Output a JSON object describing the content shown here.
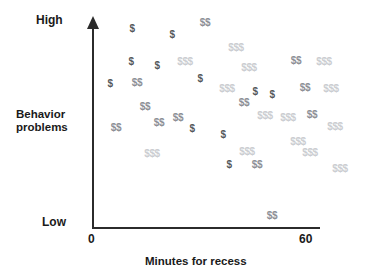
{
  "chart_data": {
    "type": "scatter",
    "title": "",
    "xlabel": "Minutes for recess",
    "ylabel": "Behavior problems",
    "xlim": [
      0,
      60
    ],
    "ylim": [
      "Low",
      "High"
    ],
    "xtick_labels": [
      "0",
      "60"
    ],
    "ytick_labels": [
      "Low",
      "High"
    ],
    "grid": false,
    "legend": "none",
    "marker_levels": [
      {
        "symbol": "$",
        "color": "#55585c",
        "meaning": "single-dollar marker"
      },
      {
        "symbol": "$$",
        "color": "#8d9096",
        "meaning": "double-dollar marker"
      },
      {
        "symbol": "$$$",
        "color": "#cbcdd1",
        "meaning": "triple-dollar marker"
      }
    ],
    "relationship": "negative",
    "points": [
      {
        "symbol": "$",
        "x": 10.4,
        "y": 0.925,
        "px": 132,
        "py": 28
      },
      {
        "symbol": "$",
        "x": 21.0,
        "y": 0.895,
        "px": 172,
        "py": 34
      },
      {
        "symbol": "$$",
        "x": 29.8,
        "y": 0.955,
        "px": 205,
        "py": 22
      },
      {
        "symbol": "$$$",
        "x": 38.0,
        "y": 0.83,
        "px": 236,
        "py": 47
      },
      {
        "symbol": "$",
        "x": 10.2,
        "y": 0.76,
        "px": 131,
        "py": 61
      },
      {
        "symbol": "$",
        "x": 17.1,
        "y": 0.74,
        "px": 157,
        "py": 65
      },
      {
        "symbol": "$$$",
        "x": 24.5,
        "y": 0.76,
        "px": 185,
        "py": 61
      },
      {
        "symbol": "$$$",
        "x": 41.5,
        "y": 0.73,
        "px": 249,
        "py": 67
      },
      {
        "symbol": "$$",
        "x": 54.0,
        "y": 0.765,
        "px": 296,
        "py": 60
      },
      {
        "symbol": "$$$",
        "x": 61.5,
        "y": 0.76,
        "px": 324,
        "py": 61
      },
      {
        "symbol": "$",
        "x": 4.5,
        "y": 0.645,
        "px": 110,
        "py": 83
      },
      {
        "symbol": "$$",
        "x": 11.5,
        "y": 0.65,
        "px": 137,
        "py": 82
      },
      {
        "symbol": "$",
        "x": 28.5,
        "y": 0.67,
        "px": 200,
        "py": 78
      },
      {
        "symbol": "$$$",
        "x": 35.5,
        "y": 0.62,
        "px": 227,
        "py": 88
      },
      {
        "symbol": "$",
        "x": 43.0,
        "y": 0.605,
        "px": 255,
        "py": 91
      },
      {
        "symbol": "$",
        "x": 47.5,
        "y": 0.59,
        "px": 272,
        "py": 94
      },
      {
        "symbol": "$$",
        "x": 56.5,
        "y": 0.625,
        "px": 305,
        "py": 87
      },
      {
        "symbol": "$$$",
        "x": 63.5,
        "y": 0.62,
        "px": 331,
        "py": 88
      },
      {
        "symbol": "$$",
        "x": 13.5,
        "y": 0.525,
        "px": 145,
        "py": 106
      },
      {
        "symbol": "$$",
        "x": 40.0,
        "y": 0.545,
        "px": 244,
        "py": 102
      },
      {
        "symbol": "$$",
        "x": 22.5,
        "y": 0.47,
        "px": 178,
        "py": 117
      },
      {
        "symbol": "$$$",
        "x": 45.5,
        "y": 0.48,
        "px": 265,
        "py": 115
      },
      {
        "symbol": "$$$",
        "x": 52.0,
        "y": 0.47,
        "px": 288,
        "py": 117
      },
      {
        "symbol": "$$",
        "x": 58.5,
        "y": 0.485,
        "px": 312,
        "py": 114
      },
      {
        "symbol": "$$",
        "x": 6.0,
        "y": 0.42,
        "px": 116,
        "py": 127
      },
      {
        "symbol": "$$",
        "x": 17.5,
        "y": 0.445,
        "px": 159,
        "py": 122
      },
      {
        "symbol": "$",
        "x": 26.5,
        "y": 0.415,
        "px": 192,
        "py": 128
      },
      {
        "symbol": "$",
        "x": 34.5,
        "y": 0.385,
        "px": 223,
        "py": 134
      },
      {
        "symbol": "$$$",
        "x": 64.5,
        "y": 0.425,
        "px": 335,
        "py": 126
      },
      {
        "symbol": "$$$",
        "x": 54.5,
        "y": 0.35,
        "px": 298,
        "py": 141
      },
      {
        "symbol": "$$$",
        "x": 15.5,
        "y": 0.29,
        "px": 152,
        "py": 153
      },
      {
        "symbol": "$$$",
        "x": 41.0,
        "y": 0.3,
        "px": 247,
        "py": 151
      },
      {
        "symbol": "$$$",
        "x": 58.0,
        "y": 0.295,
        "px": 310,
        "py": 152
      },
      {
        "symbol": "$",
        "x": 36.0,
        "y": 0.235,
        "px": 229,
        "py": 164
      },
      {
        "symbol": "$$",
        "x": 43.5,
        "y": 0.235,
        "px": 257,
        "py": 164
      },
      {
        "symbol": "$$$",
        "x": 66.0,
        "y": 0.215,
        "px": 340,
        "py": 168
      },
      {
        "symbol": "$$",
        "x": 40.5,
        "y": 0.065,
        "px": 272,
        "py": 215
      }
    ]
  },
  "labels": {
    "y_high": "High",
    "y_low": "Low",
    "x_min": "0",
    "x_max": "60",
    "y_title_line1": "Behavior",
    "y_title_line2": "problems",
    "x_title": "Minutes for recess"
  }
}
